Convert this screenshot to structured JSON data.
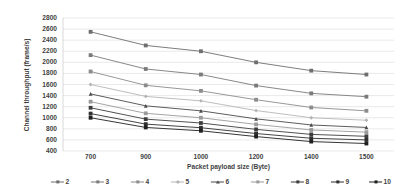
{
  "chart_data": {
    "type": "line",
    "title": "",
    "xlabel": "Packet payload size (Byte)",
    "ylabel": "Channel throughput (frame/s)",
    "x": [
      700,
      900,
      1000,
      1200,
      1400,
      1500
    ],
    "xtick_labels": [
      "700",
      "900",
      "1000",
      "1200",
      "1400",
      "1500"
    ],
    "ytick_labels": [
      "2800",
      "2600",
      "2400",
      "2200",
      "2000",
      "1800",
      "1600",
      "1400",
      "1200",
      "1000",
      "800",
      "600",
      "400"
    ],
    "ylim": [
      400,
      2800
    ],
    "ytick_step": 200,
    "grid": "horizontal",
    "legend_position": "bottom",
    "series": [
      {
        "name": "2",
        "values": [
          2550,
          2305,
          2200,
          2000,
          1850,
          1780
        ],
        "color": "#6e6e6e",
        "marker": "square"
      },
      {
        "name": "3",
        "values": [
          2130,
          1880,
          1780,
          1580,
          1440,
          1380
        ],
        "color": "#7a7a7a",
        "marker": "square"
      },
      {
        "name": "4",
        "values": [
          1835,
          1585,
          1485,
          1325,
          1185,
          1125
        ],
        "color": "#8c8c8c",
        "marker": "square"
      },
      {
        "name": "5",
        "values": [
          1600,
          1385,
          1305,
          1130,
          1000,
          955
        ],
        "color": "#b5b5b5",
        "marker": "diamond"
      },
      {
        "name": "6",
        "values": [
          1430,
          1215,
          1125,
          980,
          870,
          825
        ],
        "color": "#4a4a4a",
        "marker": "triangle"
      },
      {
        "name": "7",
        "values": [
          1290,
          1080,
          1000,
          880,
          780,
          740
        ],
        "color": "#9a9a9a",
        "marker": "square"
      },
      {
        "name": "8",
        "values": [
          1180,
          975,
          905,
          790,
          700,
          665
        ],
        "color": "#3d3d3d",
        "marker": "square"
      },
      {
        "name": "9",
        "values": [
          1075,
          885,
          820,
          715,
          630,
          600
        ],
        "color": "#2f2f2f",
        "marker": "square"
      },
      {
        "name": "10",
        "values": [
          1000,
          825,
          765,
          660,
          570,
          535
        ],
        "color": "#1f1f1f",
        "marker": "square"
      }
    ]
  },
  "axis": {
    "y_title": "Channel throughput (frame/s)",
    "x_title": "Packet payload size (Byte)"
  }
}
